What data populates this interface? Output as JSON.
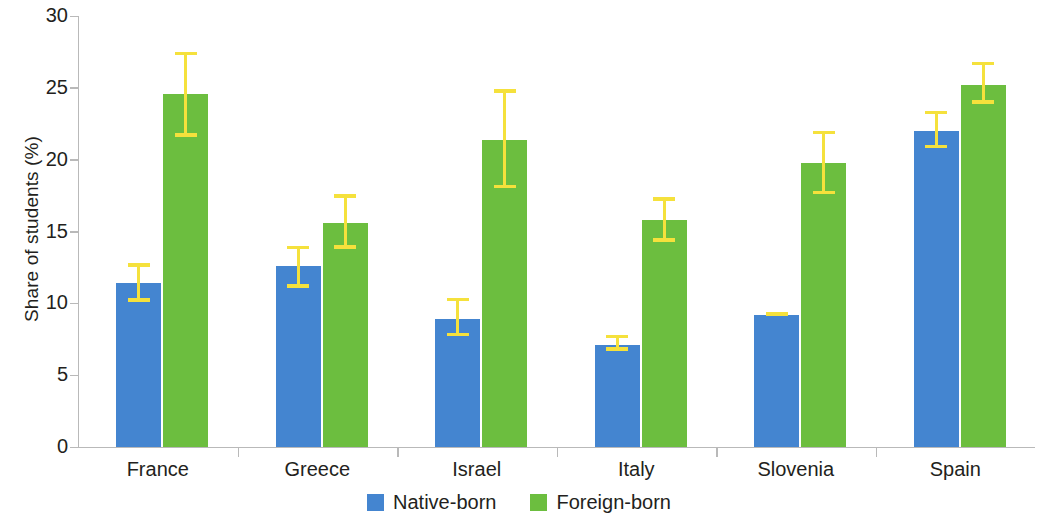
{
  "chart_data": {
    "type": "bar",
    "title": "",
    "xlabel": "",
    "ylabel": "Share of students (%)",
    "ylim": [
      0,
      30
    ],
    "yticks": [
      0,
      5,
      10,
      15,
      20,
      25,
      30
    ],
    "ytick_labels": [
      "0",
      "5",
      "10",
      "15",
      "20",
      "25",
      "30"
    ],
    "grid": false,
    "legend_position": "bottom-center",
    "categories": [
      "France",
      "Greece",
      "Israel",
      "Italy",
      "Slovenia",
      "Spain"
    ],
    "series": [
      {
        "name": "Native-born",
        "color": "#4485d0",
        "values": [
          11.4,
          12.6,
          8.9,
          7.1,
          9.2,
          22.0
        ],
        "error_low": [
          10.1,
          11.1,
          7.7,
          6.7,
          9.1,
          20.8
        ],
        "error_high": [
          12.8,
          14.0,
          10.4,
          7.8,
          9.4,
          23.4
        ]
      },
      {
        "name": "Foreign-born",
        "color": "#6cbe3f",
        "values": [
          24.6,
          15.6,
          21.4,
          15.8,
          19.8,
          25.2
        ],
        "error_low": [
          21.6,
          13.8,
          18.0,
          14.3,
          17.6,
          23.9
        ],
        "error_high": [
          27.5,
          17.6,
          24.9,
          17.4,
          22.0,
          26.8
        ]
      }
    ],
    "error_bar_color": "#f5e13c",
    "axis_color": "#b9b9b9"
  },
  "axis": {
    "y_title": "Share of students (%)"
  },
  "legend": {
    "items": [
      {
        "label": "Native-born",
        "swatch": "native"
      },
      {
        "label": "Foreign-born",
        "swatch": "foreign"
      }
    ]
  }
}
